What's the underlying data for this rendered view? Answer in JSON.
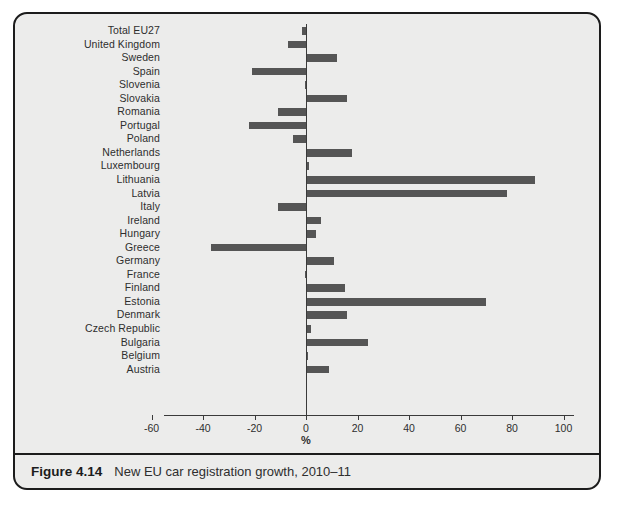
{
  "figure": {
    "caption_number": "Figure 4.14",
    "caption_text": "New EU car registration growth, 2010–11"
  },
  "chart_data": {
    "type": "bar",
    "orientation": "horizontal",
    "title": "New EU car registration growth, 2010–11",
    "xlabel": "%",
    "ylabel": "",
    "xlim": [
      -60,
      100
    ],
    "xticks": [
      -60,
      -40,
      -20,
      0,
      20,
      40,
      60,
      80,
      100
    ],
    "xtick_labels": [
      "-60",
      "-40",
      "-20",
      "0",
      "20",
      "40",
      "60",
      "80",
      "100"
    ],
    "grid": false,
    "legend": null,
    "bar_color": "#555555",
    "axis_color": "#3a3a3a",
    "background_color": "#ececeb",
    "border_color": "#1c1c1c",
    "categories": [
      "Total EU27",
      "United Kingdom",
      "Sweden",
      "Spain",
      "Slovenia",
      "Slovakia",
      "Romania",
      "Portugal",
      "Poland",
      "Netherlands",
      "Luxembourg",
      "Lithuania",
      "Latvia",
      "Italy",
      "Ireland",
      "Hungary",
      "Greece",
      "Germany",
      "France",
      "Finland",
      "Estonia",
      "Denmark",
      "Czech Republic",
      "Bulgaria",
      "Belgium",
      "Austria"
    ],
    "values": [
      -1.5,
      -7,
      12,
      -21,
      -0.5,
      16,
      -11,
      -22,
      -5,
      18,
      1,
      89,
      78,
      -11,
      6,
      4,
      -37,
      11,
      -0.5,
      15,
      70,
      16,
      2,
      24,
      0.5,
      9
    ]
  }
}
